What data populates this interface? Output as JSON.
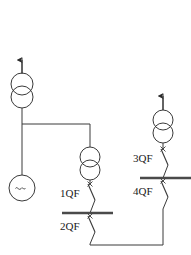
{
  "diagram": {
    "type": "single-line-diagram",
    "background_color": "#ffffff",
    "line_color": "#3a3a3a",
    "busbar_color": "#4a4a4a",
    "text_color": "#1a1a1a",
    "canvas": {
      "width": 191,
      "height": 255
    },
    "breakers": [
      {
        "id": "1QF",
        "label": "1QF",
        "label_x": 60,
        "label_y": 193,
        "pivot_x": 90,
        "pivot_y": 184,
        "end_x": 90,
        "end_y": 213,
        "state": "closed"
      },
      {
        "id": "2QF",
        "label": "2QF",
        "label_x": 60,
        "label_y": 226,
        "pivot_x": 90,
        "pivot_y": 216,
        "end_x": 90,
        "end_y": 243,
        "state": "closed"
      },
      {
        "id": "3QF",
        "label": "3QF",
        "label_x": 133,
        "label_y": 158,
        "pivot_x": 163,
        "pivot_y": 149,
        "end_x": 163,
        "end_y": 178,
        "state": "closed"
      },
      {
        "id": "4QF",
        "label": "4QF",
        "label_x": 133,
        "label_y": 191,
        "pivot_x": 163,
        "pivot_y": 181,
        "end_x": 163,
        "end_y": 209,
        "state": "closed"
      }
    ],
    "transformers": [
      {
        "id": "left-transformer",
        "cx": 22,
        "cy_top": 84,
        "cy_bottom": 97,
        "r": 11,
        "windings": 2
      },
      {
        "id": "middle-transformer",
        "cx": 90,
        "cy_top": 157,
        "cy_bottom": 170,
        "r": 10,
        "windings": 2
      },
      {
        "id": "right-transformer",
        "cx": 163,
        "cy_top": 120,
        "cy_bottom": 133,
        "r": 10,
        "windings": 2
      }
    ],
    "generator": {
      "id": "generator",
      "cx": 22,
      "cy": 188,
      "r": 13,
      "symbol": "~"
    },
    "busbars": [
      {
        "id": "left-busbar",
        "x1": 62,
        "x2": 113,
        "y": 213
      },
      {
        "id": "right-busbar",
        "x1": 140,
        "x2": 191,
        "y": 178
      }
    ],
    "outgoing_feeders": [
      {
        "id": "left-feeder-arrow",
        "x": 22,
        "y_top": 57,
        "y_bottom": 73
      },
      {
        "id": "right-feeder-arrow",
        "x": 163,
        "y_top": 92,
        "y_bottom": 109
      }
    ],
    "tie_line": {
      "id": "bottom-tie-line",
      "points": "90,243 90,245 163,245 163,209"
    }
  }
}
